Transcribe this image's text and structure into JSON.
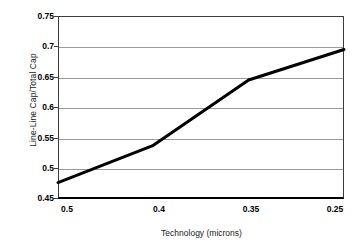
{
  "chart_data": {
    "type": "line",
    "title": "",
    "xlabel": "Technology (microns)",
    "ylabel": "Line-Line Cap/Total Cap",
    "categories": [
      "0.5",
      "0.4",
      "0.35",
      "0.25"
    ],
    "x": [
      0.5,
      0.4,
      0.35,
      0.25
    ],
    "values": [
      0.477,
      0.538,
      0.645,
      0.695
    ],
    "series": [
      {
        "name": "Line-Line Cap/Total Cap",
        "values": [
          0.477,
          0.538,
          0.645,
          0.695
        ]
      }
    ],
    "ylim": [
      0.45,
      0.75
    ],
    "yticks": [
      "0.45",
      "0.5",
      "0.55",
      "0.6",
      "0.65",
      "0.7",
      "0.75"
    ],
    "ytick_values": [
      0.45,
      0.5,
      0.55,
      0.6,
      0.65,
      0.7,
      0.75
    ],
    "xticks": [
      "0.5",
      "0.4",
      "0.35",
      "0.25"
    ],
    "grid": "horizontal",
    "legend": "none",
    "colors": {
      "line": "#000000",
      "grid": "#9a9a9a",
      "frame": "#3c3c3c",
      "axis": "#000000",
      "background": "#ffffff",
      "text": "#000000"
    },
    "line_width_px": 3
  }
}
